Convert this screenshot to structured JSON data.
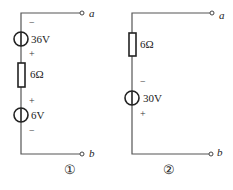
{
  "circuits": [
    {
      "id": "circuit-1",
      "caption": "①",
      "terminals": {
        "top": "a",
        "bottom": "b"
      },
      "components": [
        {
          "type": "voltage-source",
          "value": "36V",
          "top_sign": "−",
          "bottom_sign": "+"
        },
        {
          "type": "resistor",
          "value": "6Ω"
        },
        {
          "type": "voltage-source",
          "value": "6V",
          "top_sign": "+",
          "bottom_sign": "−"
        }
      ]
    },
    {
      "id": "circuit-2",
      "caption": "②",
      "terminals": {
        "top": "a",
        "bottom": "b"
      },
      "components": [
        {
          "type": "resistor",
          "value": "6Ω"
        },
        {
          "type": "voltage-source",
          "value": "30V",
          "top_sign": "−",
          "bottom_sign": "+"
        }
      ]
    }
  ],
  "colors": {
    "wire": "#555555",
    "component": "#222222",
    "background": "#ffffff"
  }
}
